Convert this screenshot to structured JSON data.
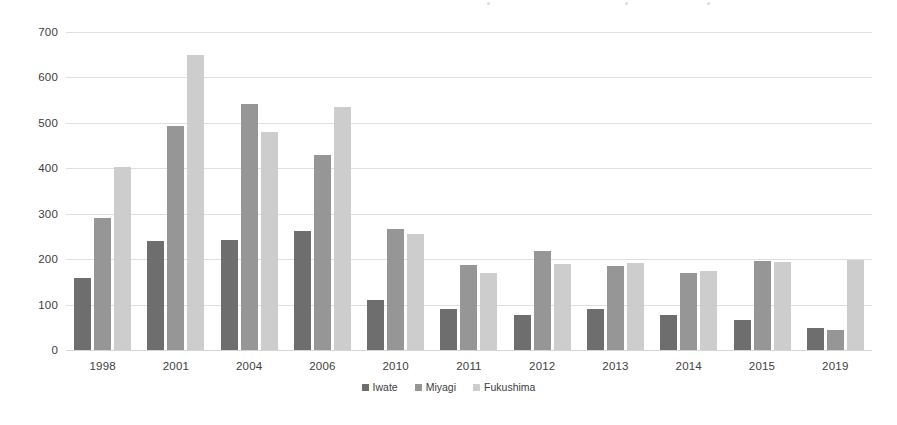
{
  "chart_data": {
    "type": "bar",
    "title": "",
    "subtitle": "",
    "xlabel": "",
    "ylabel": "",
    "categories": [
      "1998",
      "2001",
      "2004",
      "2006",
      "2010",
      "2011",
      "2012",
      "2013",
      "2014",
      "2015",
      "2019"
    ],
    "series": [
      {
        "name": "Iwate",
        "color": "#6e6e6e",
        "values": [
          158,
          241,
          242,
          262,
          110,
          91,
          78,
          91,
          76,
          66,
          49
        ]
      },
      {
        "name": "Miyagi",
        "color": "#969696",
        "values": [
          290,
          494,
          542,
          430,
          267,
          188,
          218,
          186,
          170,
          195,
          45
        ]
      },
      {
        "name": "Fukushima",
        "color": "#cdcdcd",
        "values": [
          403,
          650,
          481,
          536,
          255,
          169,
          190,
          191,
          173,
          194,
          199
        ]
      }
    ],
    "ylim": [
      0,
      700
    ],
    "ytick_values": [
      "700",
      "600",
      "500",
      "400",
      "300",
      "200",
      "100",
      "0"
    ],
    "ytick_numbers": [
      700,
      600,
      500,
      400,
      300,
      200,
      100,
      0
    ],
    "ystep": 100,
    "grid": true,
    "legend_position": "bottom"
  },
  "colors": {
    "series_iwate": "#6e6e6e",
    "series_miyagi": "#969696",
    "series_fukushima": "#cdcdcd",
    "gridline": "#d9d9d9",
    "text": "#404040",
    "background": "#ffffff"
  }
}
